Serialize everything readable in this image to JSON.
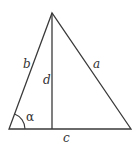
{
  "diagram": {
    "type": "triangle-with-altitude",
    "stroke_color": "#3a3a3a",
    "vertices": {
      "apex": [
        52,
        13
      ],
      "bottom_left": [
        9,
        129
      ],
      "bottom_right": [
        131,
        129
      ],
      "altitude_foot": [
        52,
        129
      ]
    },
    "labels": {
      "side_b": "b",
      "side_a": "a",
      "side_c": "c",
      "altitude_d": "d",
      "angle_alpha": "α"
    }
  }
}
